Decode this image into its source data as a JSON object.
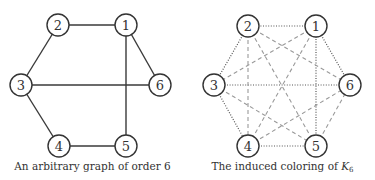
{
  "figures": [
    {
      "id": "left",
      "caption": "An arbitrary graph of order 6",
      "nodes": [
        {
          "label": "1",
          "x": 126,
          "y": 25
        },
        {
          "label": "2",
          "x": 58,
          "y": 25
        },
        {
          "label": "3",
          "x": 21,
          "y": 85
        },
        {
          "label": "4",
          "x": 59,
          "y": 146
        },
        {
          "label": "5",
          "x": 126,
          "y": 146
        },
        {
          "label": "6",
          "x": 160,
          "y": 85
        }
      ],
      "edges": [
        {
          "from": "1",
          "to": "2",
          "style": "solid"
        },
        {
          "from": "2",
          "to": "3",
          "style": "solid"
        },
        {
          "from": "3",
          "to": "4",
          "style": "solid"
        },
        {
          "from": "4",
          "to": "5",
          "style": "solid"
        },
        {
          "from": "1",
          "to": "5",
          "style": "solid"
        },
        {
          "from": "1",
          "to": "6",
          "style": "solid"
        },
        {
          "from": "3",
          "to": "6",
          "style": "solid"
        }
      ]
    },
    {
      "id": "right",
      "caption_prefix": "The induced coloring of ",
      "caption_math": "K",
      "caption_sub": "6",
      "nodes": [
        {
          "label": "1",
          "x": 316,
          "y": 26
        },
        {
          "label": "2",
          "x": 248,
          "y": 26
        },
        {
          "label": "3",
          "x": 214,
          "y": 85
        },
        {
          "label": "4",
          "x": 248,
          "y": 146
        },
        {
          "label": "5",
          "x": 316,
          "y": 146
        },
        {
          "label": "6",
          "x": 350,
          "y": 85
        }
      ],
      "edges": [
        {
          "from": "1",
          "to": "2",
          "style": "dotted"
        },
        {
          "from": "2",
          "to": "3",
          "style": "dotted"
        },
        {
          "from": "3",
          "to": "4",
          "style": "dotted"
        },
        {
          "from": "4",
          "to": "5",
          "style": "dotted"
        },
        {
          "from": "1",
          "to": "5",
          "style": "dotted"
        },
        {
          "from": "1",
          "to": "6",
          "style": "dotted"
        },
        {
          "from": "3",
          "to": "6",
          "style": "dotted"
        },
        {
          "from": "1",
          "to": "3",
          "style": "dashed"
        },
        {
          "from": "1",
          "to": "4",
          "style": "dashed"
        },
        {
          "from": "2",
          "to": "4",
          "style": "dashed"
        },
        {
          "from": "2",
          "to": "5",
          "style": "dashed"
        },
        {
          "from": "2",
          "to": "6",
          "style": "dashed"
        },
        {
          "from": "3",
          "to": "5",
          "style": "dashed"
        },
        {
          "from": "4",
          "to": "6",
          "style": "dashed"
        },
        {
          "from": "5",
          "to": "6",
          "style": "dashed"
        }
      ]
    }
  ],
  "node_radius": 11,
  "colors": {
    "node_stroke": "#333333",
    "solid_edge": "#3a3a3a",
    "dotted_edge": "#555555",
    "dashed_edge": "#9a9a9a",
    "text": "#333333"
  }
}
